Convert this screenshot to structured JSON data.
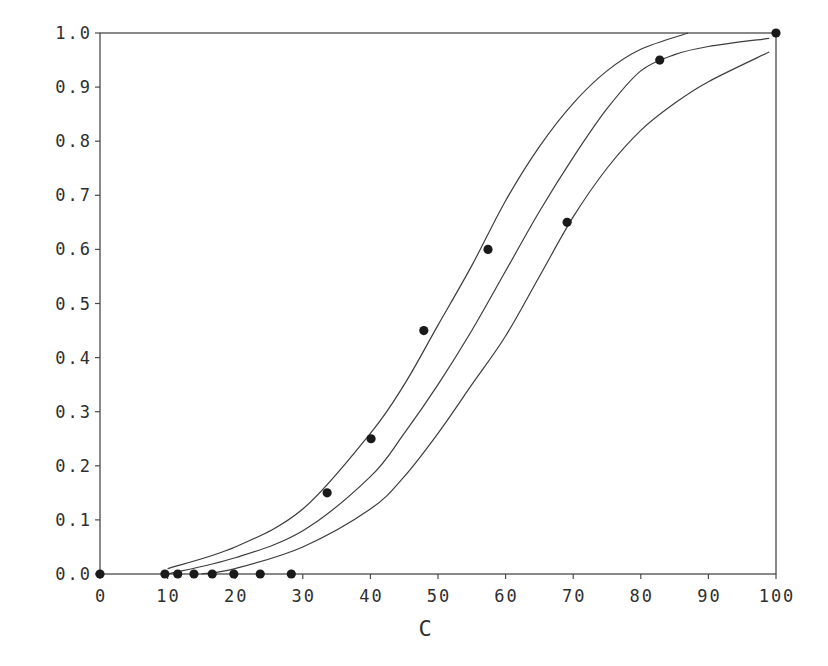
{
  "chart_data": {
    "type": "scatter",
    "title": "",
    "xlabel": "C",
    "ylabel": "",
    "xlim": [
      0,
      100
    ],
    "ylim": [
      0.0,
      1.0
    ],
    "grid": false,
    "legend": null,
    "x_ticks": [
      "0",
      "10",
      "20",
      "30",
      "40",
      "50",
      "60",
      "70",
      "80",
      "90",
      "100"
    ],
    "y_ticks": [
      "0.0",
      "0.1",
      "0.2",
      "0.3",
      "0.4",
      "0.5",
      "0.6",
      "0.7",
      "0.8",
      "0.9",
      "1.0"
    ],
    "series": [
      {
        "name": "observed",
        "kind": "points",
        "x": [
          0,
          9.6,
          11.5,
          13.9,
          16.6,
          19.8,
          23.7,
          28.3,
          33.6,
          40.1,
          47.9,
          57.4,
          69.1,
          82.8,
          100
        ],
        "y": [
          0.0,
          0.0,
          0.0,
          0.0,
          0.0,
          0.0,
          0.0,
          0.0,
          0.15,
          0.25,
          0.45,
          0.6,
          0.65,
          0.95,
          1.0
        ]
      },
      {
        "name": "upper band",
        "kind": "line",
        "x": [
          10,
          20,
          30,
          40,
          45,
          50,
          55,
          60,
          65,
          70,
          75,
          80,
          87
        ],
        "y": [
          0.01,
          0.05,
          0.12,
          0.26,
          0.35,
          0.46,
          0.57,
          0.69,
          0.79,
          0.87,
          0.93,
          0.97,
          1.0
        ]
      },
      {
        "name": "fitted",
        "kind": "line",
        "x": [
          10,
          20,
          30,
          40,
          45,
          50,
          55,
          60,
          65,
          70,
          75,
          80,
          85,
          90,
          99
        ],
        "y": [
          0.0,
          0.03,
          0.08,
          0.18,
          0.26,
          0.35,
          0.45,
          0.56,
          0.67,
          0.77,
          0.86,
          0.93,
          0.96,
          0.975,
          0.99
        ]
      },
      {
        "name": "lower band",
        "kind": "line",
        "x": [
          15,
          20,
          30,
          40,
          45,
          50,
          55,
          60,
          65,
          70,
          75,
          80,
          85,
          90,
          99
        ],
        "y": [
          0.0,
          0.01,
          0.05,
          0.12,
          0.18,
          0.26,
          0.35,
          0.44,
          0.55,
          0.66,
          0.75,
          0.82,
          0.87,
          0.91,
          0.965
        ]
      }
    ]
  },
  "axes": {
    "x_title": "C"
  },
  "style": {
    "line_color": "#3d3d3d",
    "point_color": "#1a1a1a",
    "frame_color": "#4a4a4a",
    "background": "#ffffff"
  }
}
